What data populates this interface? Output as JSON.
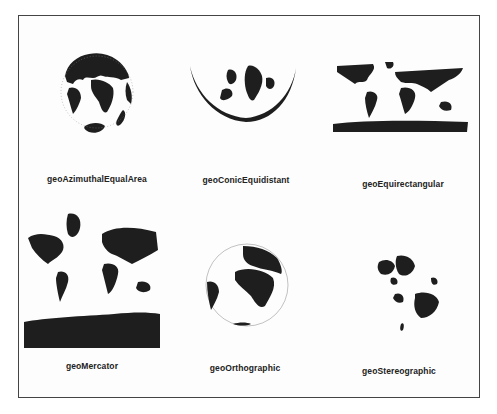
{
  "figure": {
    "title": "",
    "projections": [
      {
        "id": "azimuthal-equal-area",
        "label": "geoAzimuthalEqualArea",
        "row": 1,
        "col": 1
      },
      {
        "id": "conic-equidistant",
        "label": "geoConicEquidistant",
        "row": 1,
        "col": 2
      },
      {
        "id": "equirectangular",
        "label": "geoEquirectangular",
        "row": 1,
        "col": 3
      },
      {
        "id": "mercator",
        "label": "geoMercator",
        "row": 2,
        "col": 1
      },
      {
        "id": "orthographic",
        "label": "geoOrthographic",
        "row": 2,
        "col": 2
      },
      {
        "id": "stereographic",
        "label": "geoStereographic",
        "row": 2,
        "col": 3
      }
    ],
    "colors": {
      "land": "#1e1e1e",
      "background": "#ffffff",
      "border": "#444444"
    }
  }
}
